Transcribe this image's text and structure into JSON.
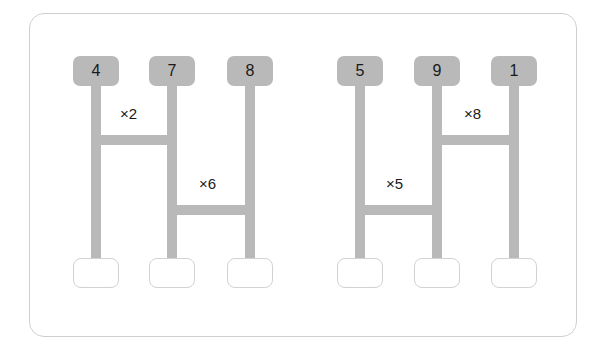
{
  "card": {
    "border_color": "#cfcfcf",
    "background": "#ffffff"
  },
  "palette": {
    "node_gray": "#b9b9b9",
    "slot_border": "#d2d2d2",
    "text": "#1a1a1a"
  },
  "diagram": {
    "type": "linked-column-groups",
    "groups": [
      {
        "id": "group-left",
        "columns": [
          {
            "id": "col-4",
            "token_label": "4",
            "x": 96,
            "slot_value": ""
          },
          {
            "id": "col-7",
            "token_label": "7",
            "x": 172,
            "slot_value": ""
          },
          {
            "id": "col-8",
            "token_label": "8",
            "x": 250,
            "slot_value": ""
          }
        ],
        "connectors": [
          {
            "id": "conn-2",
            "label": "×2",
            "from": "col-4",
            "to": "col-7",
            "y": 140
          },
          {
            "id": "conn-6",
            "label": "×6",
            "from": "col-7",
            "to": "col-8",
            "y": 210
          }
        ]
      },
      {
        "id": "group-right",
        "columns": [
          {
            "id": "col-5",
            "token_label": "5",
            "x": 360,
            "slot_value": ""
          },
          {
            "id": "col-9",
            "token_label": "9",
            "x": 437,
            "slot_value": ""
          },
          {
            "id": "col-1",
            "token_label": "1",
            "x": 514,
            "slot_value": ""
          }
        ],
        "connectors": [
          {
            "id": "conn-5",
            "label": "×5",
            "from": "col-5",
            "to": "col-9",
            "y": 210
          },
          {
            "id": "conn-8",
            "label": "×8",
            "from": "col-9",
            "to": "col-1",
            "y": 140
          }
        ]
      }
    ],
    "tokens": [
      {
        "label": "4",
        "x": 96
      },
      {
        "label": "7",
        "x": 172
      },
      {
        "label": "8",
        "x": 250
      },
      {
        "label": "5",
        "x": 360
      },
      {
        "label": "9",
        "x": 437
      },
      {
        "label": "1",
        "x": 514
      }
    ],
    "multipliers": [
      {
        "label": "×2",
        "x": 133,
        "y": 113
      },
      {
        "label": "×6",
        "x": 211,
        "y": 183
      },
      {
        "label": "×5",
        "x": 398,
        "y": 183
      },
      {
        "label": "×8",
        "x": 476,
        "y": 113
      }
    ],
    "slots": [
      {
        "id": "slot-1",
        "x": 96,
        "value": ""
      },
      {
        "id": "slot-2",
        "x": 172,
        "value": ""
      },
      {
        "id": "slot-3",
        "x": 250,
        "value": ""
      },
      {
        "id": "slot-4",
        "x": 360,
        "value": ""
      },
      {
        "id": "slot-5",
        "x": 437,
        "value": ""
      },
      {
        "id": "slot-6",
        "x": 514,
        "value": ""
      }
    ]
  }
}
